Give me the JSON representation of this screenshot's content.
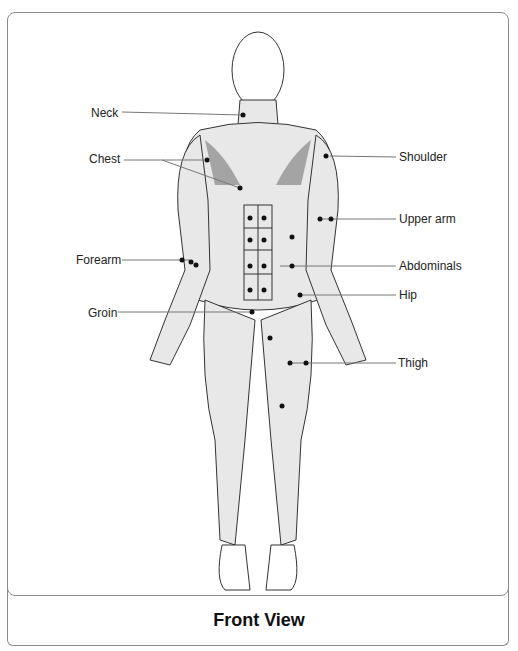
{
  "figure": {
    "caption": "Front View",
    "labels_left": [
      {
        "text": "Neck",
        "x": 91,
        "y": 106
      },
      {
        "text": "Chest",
        "x": 89,
        "y": 152
      },
      {
        "text": "Forearm",
        "x": 76,
        "y": 253
      },
      {
        "text": "Groin",
        "x": 88,
        "y": 306
      }
    ],
    "labels_right": [
      {
        "text": "Shoulder",
        "x": 399,
        "y": 152
      },
      {
        "text": "Upper arm",
        "x": 399,
        "y": 214
      },
      {
        "text": "Abdominals",
        "x": 399,
        "y": 261
      },
      {
        "text": "Hip",
        "x": 399,
        "y": 290
      },
      {
        "text": "Thigh",
        "x": 398,
        "y": 358
      }
    ]
  }
}
